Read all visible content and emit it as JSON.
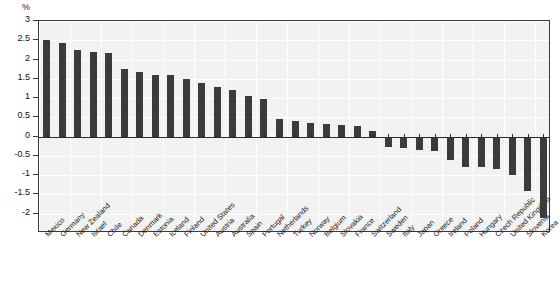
{
  "axis": {
    "unit_label": "%",
    "y_ticks": [
      "3",
      "2.5",
      "2",
      "1.5",
      "1",
      "0.5",
      "0",
      "-0.5",
      "-1",
      "-1.5",
      "-2"
    ]
  },
  "chart_data": {
    "type": "bar",
    "title": "",
    "subtitle": "",
    "xlabel": "",
    "ylabel": "%",
    "ylim": [
      -2.5,
      3
    ],
    "grid": true,
    "legend": "none",
    "bar_color": "#3b3b3b",
    "categories": [
      "Mexico",
      "Germany",
      "New Zealand",
      "Israel",
      "Chile",
      "Canada",
      "Denmark",
      "Estonia",
      "Iceland",
      "Finland",
      "United States",
      "Austria",
      "Australia",
      "Spain",
      "Portugal",
      "Netherlands",
      "Turkey",
      "Norway",
      "Belgium",
      "Slovakia",
      "France",
      "Switzerland",
      "Sweden",
      "Italy",
      "Japan",
      "Greece",
      "Ireland",
      "Poland",
      "Hungary",
      "Czech Republic",
      "United Kingdom",
      "Slovenia",
      "Korea"
    ],
    "values": [
      2.52,
      2.42,
      2.25,
      2.2,
      2.16,
      1.75,
      1.68,
      1.6,
      1.6,
      1.5,
      1.4,
      1.28,
      1.2,
      1.05,
      0.98,
      0.45,
      0.4,
      0.35,
      0.32,
      0.3,
      0.28,
      0.15,
      -0.28,
      -0.3,
      -0.35,
      -0.38,
      -0.6,
      -0.78,
      -0.8,
      -0.85,
      -1.0,
      -1.42,
      -2.1
    ]
  }
}
